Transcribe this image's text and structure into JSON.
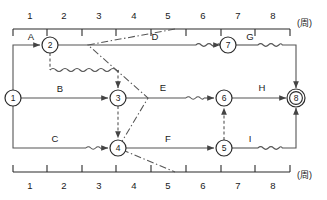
{
  "diagram": {
    "kind": "time-scaled-network-diagram",
    "unit_label": "(周)",
    "axes": {
      "top": {
        "name": "top-time-axis",
        "unit": "(周)",
        "ticks": [
          "1",
          "2",
          "3",
          "4",
          "5",
          "6",
          "7",
          "8"
        ],
        "x_start": 13,
        "x_end": 290,
        "y": 29,
        "label_position": "above"
      },
      "bottom": {
        "name": "bottom-time-axis",
        "unit": "(周)",
        "ticks": [
          "1",
          "2",
          "3",
          "4",
          "5",
          "6",
          "7",
          "8"
        ],
        "x_start": 13,
        "x_end": 290,
        "y": 172,
        "label_position": "below"
      }
    },
    "nodes": [
      {
        "id": "1",
        "label": "1",
        "x": 13,
        "y": 98,
        "double": false
      },
      {
        "id": "2",
        "label": "2",
        "x": 50,
        "y": 45,
        "double": false
      },
      {
        "id": "3",
        "label": "3",
        "x": 118,
        "y": 98,
        "double": false
      },
      {
        "id": "4",
        "label": "4",
        "x": 118,
        "y": 148,
        "double": false
      },
      {
        "id": "5",
        "label": "5",
        "x": 224,
        "y": 148,
        "double": false
      },
      {
        "id": "6",
        "label": "6",
        "x": 224,
        "y": 98,
        "double": false
      },
      {
        "id": "7",
        "label": "7",
        "x": 228,
        "y": 45,
        "double": false
      },
      {
        "id": "8",
        "label": "8",
        "x": 296,
        "y": 98,
        "double": true
      }
    ],
    "activities": [
      {
        "id": "A",
        "label": "A",
        "from": "1",
        "to": "2",
        "style": "solid",
        "has_float": false,
        "label_x": 31,
        "label_y": 40
      },
      {
        "id": "B",
        "label": "B",
        "from": "1",
        "to": "3",
        "style": "solid",
        "has_float": false,
        "label_x": 60,
        "label_y": 92
      },
      {
        "id": "C",
        "label": "C",
        "from": "1",
        "to": "4",
        "style": "solid",
        "has_float": true,
        "label_x": 55,
        "label_y": 142
      },
      {
        "id": "D",
        "label": "D",
        "from": "2",
        "to": "7",
        "style": "solid",
        "has_float": true,
        "label_x": 155,
        "label_y": 40
      },
      {
        "id": "E",
        "label": "E",
        "from": "3",
        "to": "6",
        "style": "solid",
        "has_float": true,
        "label_x": 163,
        "label_y": 91
      },
      {
        "id": "F",
        "label": "F",
        "from": "4",
        "to": "5",
        "style": "solid",
        "has_float": false,
        "label_x": 168,
        "label_y": 142
      },
      {
        "id": "G",
        "label": "G",
        "from": "7",
        "to": "8",
        "style": "solid",
        "has_float": true,
        "label_x": 250,
        "label_y": 40
      },
      {
        "id": "H",
        "label": "H",
        "from": "6",
        "to": "8",
        "style": "solid",
        "has_float": false,
        "label_x": 262,
        "label_y": 91
      },
      {
        "id": "I",
        "label": "I",
        "from": "5",
        "to": "8",
        "style": "solid",
        "has_float": true,
        "label_x": 250,
        "label_y": 142
      }
    ],
    "dummy_activities": [
      {
        "name": "dummy-2-to-3",
        "from": "2",
        "to": "3",
        "style": "dashed"
      },
      {
        "name": "dummy-3-to-4",
        "from": "3",
        "to": "4",
        "style": "dashed"
      },
      {
        "name": "dummy-5-to-6",
        "from": "5",
        "to": "6",
        "style": "dashed"
      }
    ],
    "marker_line": {
      "name": "time-scale-marker",
      "style": "dash-dot",
      "points": "175,29 88,45 148,98 118,148 175,172"
    }
  }
}
